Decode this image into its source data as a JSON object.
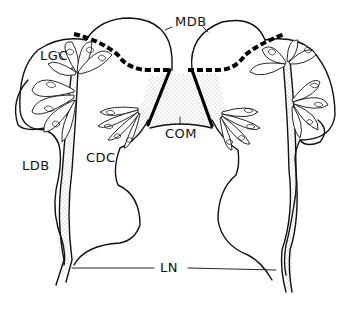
{
  "figure": {
    "type": "anatomical line drawing",
    "labels": {
      "mdb": "MDB",
      "lgc": "LGC",
      "ldb": "LDB",
      "cdc": "CDC",
      "com": "COM",
      "ln": "LN"
    },
    "colors": {
      "line": "#111111",
      "background": "#ffffff",
      "stipple": "#555555"
    }
  }
}
